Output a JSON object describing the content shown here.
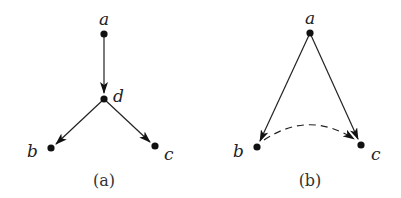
{
  "figure": {
    "panels": [
      {
        "id": "a",
        "caption": "(a)",
        "nodes": [
          {
            "name": "a",
            "label": "a",
            "x": 104,
            "y": 34
          },
          {
            "name": "d",
            "label": "d",
            "x": 104,
            "y": 99
          },
          {
            "name": "b",
            "label": "b",
            "x": 51,
            "y": 148
          },
          {
            "name": "c",
            "label": "c",
            "x": 155,
            "y": 146
          }
        ],
        "edges": [
          {
            "from": "a",
            "to": "d",
            "style": "solid",
            "directed": true
          },
          {
            "from": "d",
            "to": "b",
            "style": "solid",
            "directed": true
          },
          {
            "from": "d",
            "to": "c",
            "style": "solid",
            "directed": true
          }
        ]
      },
      {
        "id": "b",
        "caption": "(b)",
        "nodes": [
          {
            "name": "a",
            "label": "a",
            "x": 310,
            "y": 33
          },
          {
            "name": "b",
            "label": "b",
            "x": 257,
            "y": 147
          },
          {
            "name": "c",
            "label": "c",
            "x": 361,
            "y": 145
          }
        ],
        "edges": [
          {
            "from": "a",
            "to": "b",
            "style": "solid",
            "directed": true
          },
          {
            "from": "a",
            "to": "c",
            "style": "solid",
            "directed": true
          },
          {
            "from": "b",
            "to": "c",
            "style": "dashed",
            "directed": true,
            "curved": true
          }
        ]
      }
    ],
    "colors": {
      "ink": "#111111",
      "background": "#ffffff"
    }
  }
}
